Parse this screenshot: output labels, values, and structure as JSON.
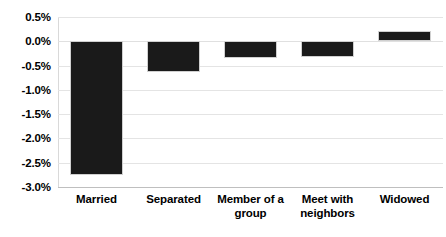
{
  "chart_data": {
    "type": "bar",
    "title": "",
    "subtitle": "",
    "xlabel": "",
    "ylabel": "",
    "categories": [
      "Married",
      "Separated",
      "Member of a group",
      "Meet with neighbors",
      "Widowed"
    ],
    "category_lines": [
      [
        "Married"
      ],
      [
        "Separated"
      ],
      [
        "Member of a",
        "group"
      ],
      [
        "Meet with",
        "neighbors"
      ],
      [
        "Widowed"
      ]
    ],
    "values": [
      -2.75,
      -0.63,
      -0.35,
      -0.33,
      0.22
    ],
    "value_labels": [
      "-2.75%",
      "-0.63%",
      "-0.35%",
      "-0.33%",
      "0.22%"
    ],
    "ylim": [
      -3.0,
      0.5
    ],
    "ytick_values": [
      0.5,
      0.0,
      -0.5,
      -1.0,
      -1.5,
      -2.0,
      -2.5,
      -3.0
    ],
    "ytick_labels": [
      "0.5%",
      "0.0%",
      "-0.5%",
      "-1.0%",
      "-1.5%",
      "-2.0%",
      "-2.5%",
      "-3.0%"
    ],
    "grid": true,
    "grid_axis": "y",
    "legend": false,
    "legend_position": "none",
    "bar_color": "#1a1a1a",
    "bar_edge_color": "#d0d0d0",
    "gridline_color": "#e4e4e4",
    "background_color": "#ffffff",
    "text_color": "#000000"
  }
}
